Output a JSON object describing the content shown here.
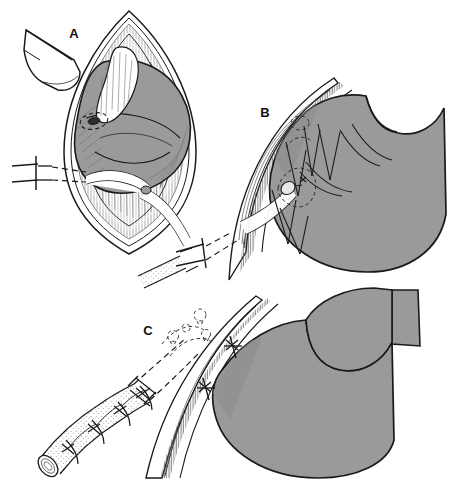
{
  "figure": {
    "background_color": "#ffffff",
    "width": 450,
    "height": 483,
    "style": "black-and-white line drawing with flat gray organ fill"
  },
  "colors": {
    "background": "#ffffff",
    "ink": "#1a1a1a",
    "organ_fill": "#9a9a9a",
    "organ_fill_shadow": "#8a8a8a",
    "tissue_fill": "#ffffff",
    "hatch_gray": "#7d7d7d",
    "tube_fill": "#f2f2f2",
    "ghost_dash": "#4d4d4d"
  },
  "panels": [
    {
      "id": "A",
      "label": "A",
      "label_x": 74,
      "label_y": 38,
      "caption_text": "A",
      "description": "Open laparotomy view through a vertical midline incision. Retractor at upper left holds the wound edge; the anterior gastric wall (gray) is delivered into the wound. A purse-string suture site is marked on the stomach and a catheter is advanced toward it from the left.",
      "elements": [
        {
          "name": "abdominal-wall-incision",
          "kind": "tissue-outline"
        },
        {
          "name": "retractor-blade",
          "kind": "instrument"
        },
        {
          "name": "stomach-anterior-wall",
          "kind": "organ",
          "fill": "#9a9a9a"
        },
        {
          "name": "purse-string-suture-site",
          "kind": "suture"
        },
        {
          "name": "gastrostomy-catheter",
          "kind": "tube"
        },
        {
          "name": "catheter-stub-left",
          "kind": "tube"
        },
        {
          "name": "muscle-fascia-hatching",
          "kind": "texture"
        }
      ]
    },
    {
      "id": "B",
      "label": "B",
      "label_x": 265,
      "label_y": 117,
      "caption_text": "B",
      "description": "Cut-away sagittal view of the abdominal wall layers. The catheter passes obliquely through the wall into the stomach; multiple interrupted sutures tack the gastric serosa to the peritoneum and posterior fascia, forming a tunnel.",
      "elements": [
        {
          "name": "abdominal-wall-layers",
          "kind": "tissue-outline"
        },
        {
          "name": "peritoneum-hatching",
          "kind": "texture"
        },
        {
          "name": "stomach-body",
          "kind": "organ",
          "fill": "#9a9a9a"
        },
        {
          "name": "interrupted-sutures",
          "kind": "suture",
          "count": 6
        },
        {
          "name": "gastrostomy-catheter",
          "kind": "tube"
        },
        {
          "name": "catheter-exit-stub",
          "kind": "tube"
        },
        {
          "name": "ghost-suture-outline",
          "kind": "dashed-guide"
        }
      ]
    },
    {
      "id": "C",
      "label": "C",
      "label_x": 148,
      "label_y": 335,
      "caption_text": "C",
      "description": "Completed construction. The catheter is seated in a serosa-lined tunnel held by two anchoring sutures to the abdominal wall. An inset at lower left shows the tube wrapped by a sutured seromuscular sleeve; dashed ghost outlines mark the former suture positions.",
      "elements": [
        {
          "name": "abdominal-wall-layers",
          "kind": "tissue-outline"
        },
        {
          "name": "peritoneum-hatching",
          "kind": "texture"
        },
        {
          "name": "stomach-body",
          "kind": "organ",
          "fill": "#9a9a9a"
        },
        {
          "name": "anchoring-sutures",
          "kind": "suture",
          "count": 2
        },
        {
          "name": "serosal-tunnel-sleeve",
          "kind": "tube-detail"
        },
        {
          "name": "gastrostomy-catheter",
          "kind": "tube"
        },
        {
          "name": "catheter-open-tip",
          "kind": "tube-detail"
        },
        {
          "name": "ghost-suture-outlines",
          "kind": "dashed-guide",
          "count": 4
        }
      ]
    }
  ]
}
